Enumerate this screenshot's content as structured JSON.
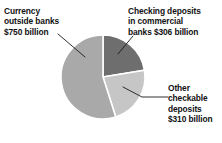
{
  "figure": {
    "background_color": "#ffffff",
    "title": ""
  },
  "labels": {
    "currency": "Currency\noutside banks\n$750 billion",
    "checking": "Checking deposits\nin commercial\nbanks $306 billion",
    "other": "Other\ncheckable\ndeposits\n$310 billion"
  },
  "leaders": {
    "currency_leader_name": "leader-line-currency",
    "checking_leader_name": "leader-line-checking",
    "other_leader_name": "leader-line-other"
  },
  "chart_data": {
    "type": "pie",
    "title": "",
    "unit": "billion USD",
    "total": 1366,
    "legend_position": "callout-labels",
    "start_angle_deg": 0,
    "direction": "clockwise",
    "categories": [
      "Checking deposits in commercial banks",
      "Other checkable deposits",
      "Currency outside banks"
    ],
    "values": [
      306,
      310,
      750
    ],
    "value_labels": [
      "$306 billion",
      "$310 billion",
      "$750 billion"
    ],
    "percentages": [
      22.4,
      22.7,
      54.9
    ],
    "colors": [
      "#6e6e6e",
      "#c6c6c6",
      "#a9a9a9"
    ],
    "slices": [
      {
        "name": "Checking deposits in commercial banks",
        "value": 306,
        "value_label": "$306 billion",
        "percent": 22.4,
        "color": "#6e6e6e",
        "position": "top-right"
      },
      {
        "name": "Other checkable deposits",
        "value": 310,
        "value_label": "$310 billion",
        "percent": 22.7,
        "color": "#c6c6c6",
        "position": "bottom-right"
      },
      {
        "name": "Currency outside banks",
        "value": 750,
        "value_label": "$750 billion",
        "percent": 54.9,
        "color": "#a9a9a9",
        "position": "left"
      }
    ]
  }
}
